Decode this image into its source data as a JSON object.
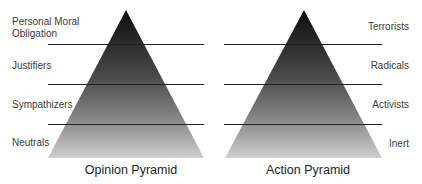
{
  "opinion_pyramid": {
    "title": "Opinion Pyramid",
    "levels": [
      {
        "label_line1": "Personal Moral",
        "label_line2": "Obligation"
      },
      {
        "label_line1": "Justifiers"
      },
      {
        "label_line1": "Sympathizers"
      },
      {
        "label_line1": "Neutrals"
      }
    ]
  },
  "action_pyramid": {
    "title": "Action Pyramid",
    "levels": [
      {
        "label_line1": "Terrorists"
      },
      {
        "label_line1": "Radicals"
      },
      {
        "label_line1": "Activists"
      },
      {
        "label_line1": "Inert"
      }
    ]
  },
  "colors": {
    "apex": "#111111",
    "base": "#c8c8c8",
    "divider": "#222222"
  }
}
